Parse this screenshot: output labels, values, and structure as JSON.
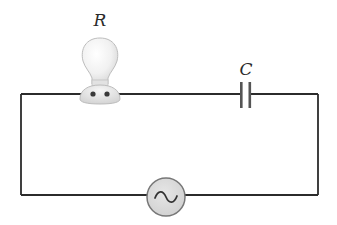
{
  "diagram": {
    "type": "circuit",
    "components": [
      {
        "id": "bulb",
        "kind": "light-bulb",
        "label": "R"
      },
      {
        "id": "capacitor",
        "kind": "capacitor",
        "label": "C"
      },
      {
        "id": "source",
        "kind": "ac-source",
        "symbol": "~"
      }
    ],
    "labels": {
      "resistor": "R",
      "capacitor": "C"
    },
    "colors": {
      "wire": "#2b2b2b",
      "bulb_glass": "#efefef",
      "bulb_outline": "#b5b5b5",
      "source_fill": "#d8d8d8",
      "source_stroke": "#777777",
      "capacitor_plate": "#555555"
    }
  }
}
